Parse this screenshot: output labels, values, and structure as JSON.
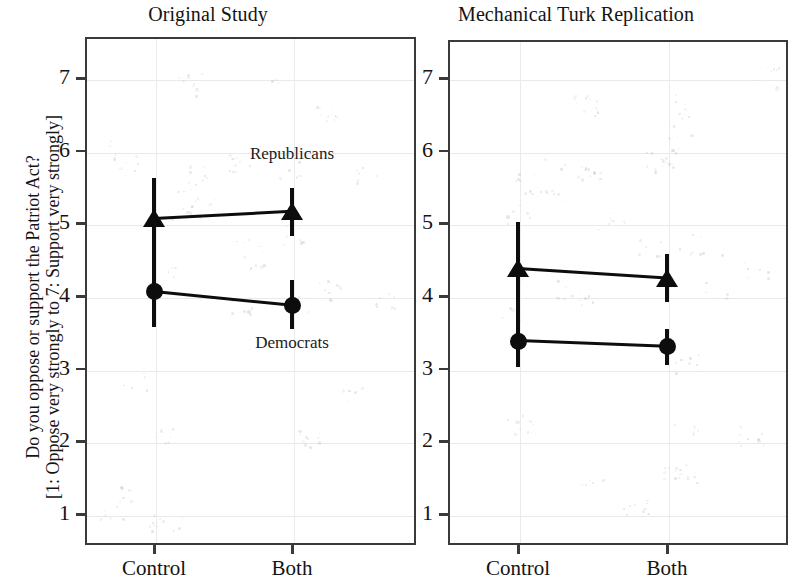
{
  "figure": {
    "ylabel_line1": "Do you oppose or support the Patriot Act?",
    "ylabel_line2": "[1: Oppose very strongly to 7: Support very strongly]"
  },
  "panels": [
    {
      "title": "Original Study"
    },
    {
      "title": "Mechanical Turk Replication"
    }
  ],
  "chart_data": {
    "type": "line",
    "title": "",
    "subtitle": "",
    "xlabel": "",
    "ylabel": "Do you oppose or support the Patriot Act? [1: Oppose very strongly to 7: Support very strongly]",
    "ylim": [
      0.55,
      7.6
    ],
    "yticks": [
      1,
      2,
      3,
      4,
      5,
      6,
      7
    ],
    "ytick_labels": [
      "1",
      "2",
      "3",
      "4",
      "5",
      "6",
      "7"
    ],
    "categories": [
      "Control",
      "Both"
    ],
    "grid": true,
    "legend": "inline annotations",
    "error_bars": "95% confidence interval",
    "panels": [
      {
        "title": "Original Study",
        "categories": [
          "Control",
          "Both"
        ],
        "series": [
          {
            "name": "Republicans",
            "marker": "triangle",
            "values": [
              5.07,
              5.17
            ],
            "ci_low": [
              4.45,
              4.83
            ],
            "ci_high": [
              5.62,
              5.48
            ]
          },
          {
            "name": "Democrats",
            "marker": "circle",
            "values": [
              4.06,
              3.87
            ],
            "ci_low": [
              3.57,
              3.55
            ],
            "ci_high": [
              4.45,
              4.22
            ]
          }
        ],
        "annotations": [
          {
            "text": "Republicans",
            "x": "Both",
            "y": 5.95
          },
          {
            "text": "Democrats",
            "x": "Both",
            "y": 3.35
          }
        ]
      },
      {
        "title": "Mechanical Turk Replication",
        "categories": [
          "Control",
          "Both"
        ],
        "series": [
          {
            "name": "Republicans",
            "marker": "triangle",
            "values": [
              4.38,
              4.25
            ],
            "ci_low": [
              3.72,
              3.92
            ],
            "ci_high": [
              5.02,
              4.58
            ]
          },
          {
            "name": "Democrats",
            "marker": "circle",
            "values": [
              3.38,
              3.3
            ],
            "ci_low": [
              3.02,
              3.05
            ],
            "ci_high": [
              3.72,
              3.55
            ]
          }
        ],
        "annotations": []
      }
    ]
  }
}
